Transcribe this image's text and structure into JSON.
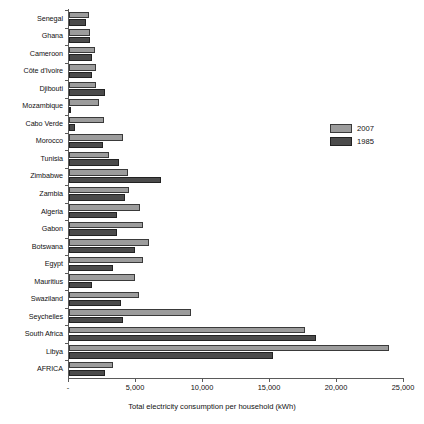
{
  "chart_data": {
    "type": "bar",
    "orientation": "horizontal",
    "title": "",
    "xlabel": "Total electricity consumption per household  (kWh)",
    "ylabel": "",
    "xlim": [
      0,
      25000
    ],
    "xticks": [
      "-",
      "5,000",
      "10,000",
      "15,000",
      "20,000",
      "25,000"
    ],
    "xtick_values": [
      0,
      5000,
      10000,
      15000,
      20000,
      25000
    ],
    "grid": false,
    "legend_position": "right",
    "categories": [
      "Senegal",
      "Ghana",
      "Cameroon",
      "Côte d'Ivoire",
      "Djibouti",
      "Mozambique",
      "Cabo Verde",
      "Morocco",
      "Tunisia",
      "Zimbabwe",
      "Zambia",
      "Algeria",
      "Gabon",
      "Botswana",
      "Egypt",
      "Mauritius",
      "Swaziland",
      "Seychelles",
      "South Africa",
      "Libya",
      "AFRICA"
    ],
    "series": [
      {
        "name": "2007",
        "color": "#9c9c9c",
        "values": [
          1500,
          1600,
          1950,
          2050,
          2000,
          2250,
          2600,
          4050,
          3000,
          4400,
          4500,
          5300,
          5500,
          5950,
          5500,
          4900,
          5250,
          9100,
          17600,
          23900,
          3250
        ]
      },
      {
        "name": "1985",
        "color": "#4b4b4b",
        "values": [
          1250,
          1600,
          1700,
          1700,
          2700,
          120,
          450,
          2500,
          3750,
          6900,
          4200,
          3600,
          3600,
          4900,
          3300,
          1750,
          3900,
          4000,
          18400,
          15250,
          2650
        ]
      }
    ]
  },
  "legend": {
    "items": [
      {
        "label": "2007",
        "swatch_class": "s2007"
      },
      {
        "label": "1985",
        "swatch_class": "s1985"
      }
    ]
  }
}
